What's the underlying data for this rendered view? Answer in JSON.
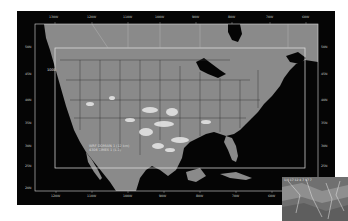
{
  "figure": {
    "type": "model-domain-map",
    "region": "Continental United States",
    "colors": {
      "page_background": "#ffffff",
      "ocean": "#050505",
      "land": "#8a8a8a",
      "border_lines": "#3a3a3a",
      "grid_box": "#d9d9d9",
      "cloud": "#e8e8e8"
    }
  },
  "grid": {
    "top_lon_labels": [
      "130W",
      "120W",
      "110W",
      "100W",
      "90W",
      "80W",
      "70W",
      "60W"
    ],
    "bottom_lon_labels": [
      "120W",
      "110W",
      "100W",
      "90W",
      "80W",
      "70W",
      "60W"
    ],
    "left_lat_labels": [
      "50N",
      "45N",
      "40N",
      "35N",
      "30N",
      "25N",
      "20N"
    ],
    "right_lat_labels": [
      "50N",
      "45N",
      "40N",
      "35N",
      "30N",
      "25N",
      "20N"
    ]
  },
  "domain_box": {
    "label": "1000"
  },
  "annotation": {
    "line1": "WRF DOMAIN 1 (12 km)",
    "line2": "4306 TIMES 1 (L 2)"
  },
  "inset": {
    "caption": "1/4 17 12 4 7 17 7"
  }
}
